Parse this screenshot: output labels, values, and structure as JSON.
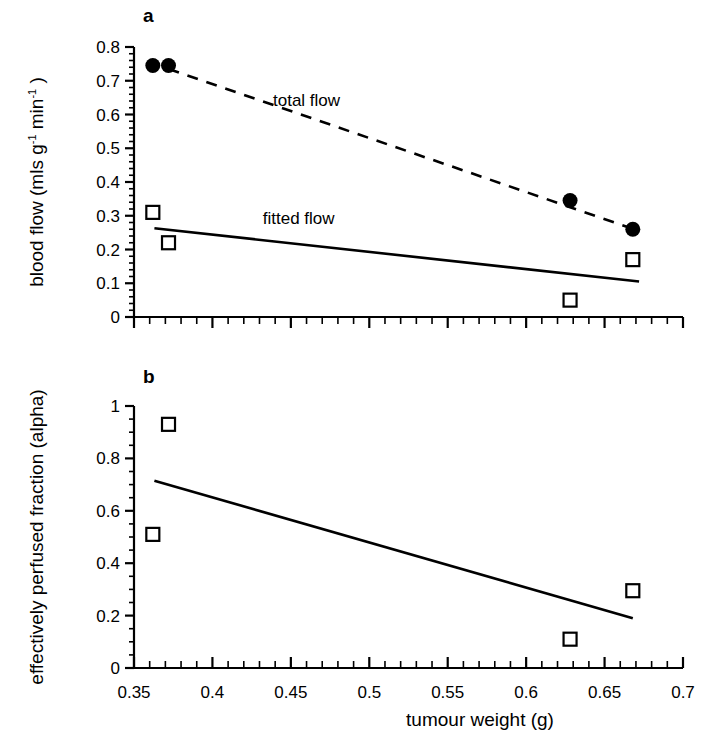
{
  "figure": {
    "background_color": "#ffffff",
    "ink_color": "#000000"
  },
  "xaxis": {
    "title": "tumour weight (g)",
    "tick_labels": [
      "0.35",
      "0.4",
      "0.45",
      "0.5",
      "0.55",
      "0.6",
      "0.65",
      "0.7"
    ],
    "range": [
      0.35,
      0.7
    ],
    "major_step": 0.05,
    "minor_step": 0.01
  },
  "panel_a": {
    "label": "a",
    "ylabel_parts": {
      "lead": "blood flow (mls g",
      "sup1": "-1",
      "mid": " min",
      "sup2": "-1",
      "tail": " )"
    },
    "ylabel_plain": "blood flow (mls g-1 min-1 )",
    "ytick_labels": [
      "0",
      "0.1",
      "0.2",
      "0.3",
      "0.4",
      "0.5",
      "0.6",
      "0.7",
      "0.8"
    ],
    "annotation_total": "total flow",
    "annotation_fitted": "fitted flow"
  },
  "panel_b": {
    "label": "b",
    "ylabel": "effectively perfused fraction (alpha)",
    "ytick_labels": [
      "0",
      "0.2",
      "0.4",
      "0.6",
      "0.8",
      "1"
    ]
  },
  "chart_data": [
    {
      "type": "scatter",
      "panel": "a",
      "title": "",
      "xlabel": "tumour weight (g)",
      "ylabel": "blood flow (mls g-1 min-1)",
      "xlim": [
        0.35,
        0.7
      ],
      "ylim": [
        0,
        0.8
      ],
      "grid": false,
      "legend_position": "inline-annotation",
      "series": [
        {
          "name": "total flow",
          "marker": "filled-circle",
          "x": [
            0.362,
            0.372,
            0.628,
            0.668
          ],
          "y": [
            0.745,
            0.745,
            0.345,
            0.26
          ]
        },
        {
          "name": "fitted flow",
          "marker": "open-square",
          "x": [
            0.362,
            0.372,
            0.628,
            0.668
          ],
          "y": [
            0.31,
            0.22,
            0.05,
            0.17
          ]
        }
      ],
      "fit_lines": [
        {
          "name": "total flow",
          "style": "dashed",
          "x": [
            0.372,
            0.672
          ],
          "y": [
            0.735,
            0.255
          ]
        },
        {
          "name": "fitted flow",
          "style": "solid",
          "x": [
            0.363,
            0.672
          ],
          "y": [
            0.263,
            0.105
          ]
        }
      ],
      "annotations": [
        {
          "text": "total flow",
          "x": 0.46,
          "y": 0.625
        },
        {
          "text": "fitted flow",
          "x": 0.455,
          "y": 0.275
        }
      ]
    },
    {
      "type": "scatter",
      "panel": "b",
      "title": "",
      "xlabel": "tumour weight (g)",
      "ylabel": "effectively perfused fraction (alpha)",
      "xlim": [
        0.35,
        0.7
      ],
      "ylim": [
        0,
        1
      ],
      "grid": false,
      "legend_position": "none",
      "series": [
        {
          "name": "effectively perfused fraction",
          "marker": "open-square",
          "x": [
            0.362,
            0.372,
            0.628,
            0.668
          ],
          "y": [
            0.51,
            0.93,
            0.11,
            0.295
          ]
        }
      ],
      "fit_lines": [
        {
          "name": "regression",
          "style": "solid",
          "x": [
            0.363,
            0.668
          ],
          "y": [
            0.715,
            0.19
          ]
        }
      ],
      "annotations": []
    }
  ]
}
